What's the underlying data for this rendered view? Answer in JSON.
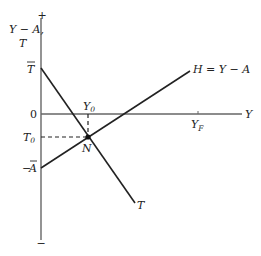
{
  "diagram": {
    "y_axis_label_line1": "Y − A,",
    "y_axis_label_line2": "T",
    "plus_sign": "+",
    "minus_sign": "−",
    "zero_label": "0",
    "x_axis_label": "Y",
    "t_bar_label": "T",
    "minus_a_bar_label_sign": "−",
    "a_bar_label": "A",
    "t0_label": "T",
    "t0_sub": "0",
    "y0_label": "Y",
    "y0_sub": "0",
    "yf_label": "Y",
    "yf_sub": "F",
    "n_label": "N",
    "h_line_label": "H = Y − A",
    "t_line_label": "T",
    "colors": {
      "axis": "#666666",
      "line": "#222222",
      "text": "#222222"
    }
  }
}
